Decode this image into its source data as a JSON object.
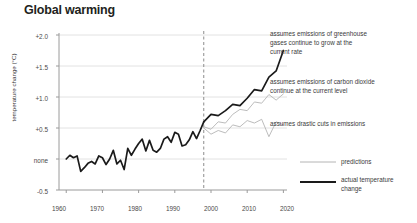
{
  "chart_data": {
    "type": "line",
    "title": "Global warming",
    "xlabel": "",
    "ylabel": "temperature change (°C)",
    "xlim": [
      1958,
      2021
    ],
    "ylim": [
      -0.5,
      2.0
    ],
    "grid": true,
    "legend_position": "bottom-right",
    "x_ticks": [
      "1960",
      "1970",
      "1980",
      "1990",
      "2000",
      "2010",
      "2020"
    ],
    "y_ticks": [
      "+2.0",
      "+1.5",
      "+1.0",
      "+0.5",
      "none",
      "-0.5"
    ],
    "y_tick_values": [
      2.0,
      1.5,
      1.0,
      0.5,
      0.0,
      -0.5
    ],
    "split_year": 1998,
    "series": [
      {
        "name": "actual temperature change",
        "style": "thick-black",
        "x": [
          1960,
          1961,
          1962,
          1963,
          1964,
          1965,
          1966,
          1967,
          1968,
          1969,
          1970,
          1971,
          1972,
          1973,
          1974,
          1975,
          1976,
          1977,
          1978,
          1979,
          1980,
          1981,
          1982,
          1983,
          1984,
          1985,
          1986,
          1987,
          1988,
          1989,
          1990,
          1991,
          1992,
          1993,
          1994,
          1995,
          1996,
          1997,
          1998
        ],
        "values": [
          0.0,
          0.06,
          0.02,
          0.05,
          -0.2,
          -0.14,
          -0.07,
          -0.04,
          -0.08,
          0.05,
          0.02,
          -0.09,
          0.0,
          0.14,
          -0.08,
          -0.02,
          -0.17,
          0.17,
          0.06,
          0.16,
          0.25,
          0.32,
          0.13,
          0.3,
          0.14,
          0.11,
          0.17,
          0.32,
          0.36,
          0.27,
          0.43,
          0.4,
          0.21,
          0.23,
          0.31,
          0.44,
          0.33,
          0.46,
          0.6
        ]
      },
      {
        "name": "assumes emissions of greenhouse gases continue to grow at the current rate",
        "style": "thick-black",
        "x": [
          1998,
          2000,
          2002,
          2004,
          2006,
          2008,
          2010,
          2012,
          2014,
          2016,
          2018,
          2020
        ],
        "values": [
          0.6,
          0.72,
          0.7,
          0.78,
          0.88,
          0.86,
          0.98,
          1.12,
          1.1,
          1.32,
          1.42,
          1.75
        ]
      },
      {
        "name": "assumes emissions of  carbon dioxide continue at the current level",
        "style": "thin-gray",
        "x": [
          1998,
          2000,
          2002,
          2004,
          2006,
          2008,
          2010,
          2012,
          2014,
          2016,
          2018,
          2020
        ],
        "values": [
          0.52,
          0.48,
          0.6,
          0.58,
          0.72,
          0.8,
          0.78,
          0.92,
          0.9,
          1.04,
          0.95,
          1.05
        ]
      },
      {
        "name": "assumes drastic cuts in emissions",
        "style": "thin-gray",
        "x": [
          1998,
          2000,
          2002,
          2004,
          2006,
          2008,
          2010,
          2012,
          2014,
          2016,
          2018,
          2020
        ],
        "values": [
          0.5,
          0.4,
          0.46,
          0.42,
          0.55,
          0.52,
          0.62,
          0.58,
          0.64,
          0.36,
          0.6,
          0.55
        ]
      }
    ],
    "annotations": [
      {
        "text": "assumes emissions of greenhouse\ngases continue to grow at the\ncurrent rate",
        "anchor_x": 270,
        "anchor_y": 30
      },
      {
        "text": "assumes emissions of  carbon dioxide\ncontinue at the current level",
        "anchor_x": 270,
        "anchor_y": 78
      },
      {
        "text": "assumes drastic cuts in emissions",
        "anchor_x": 270,
        "anchor_y": 120
      }
    ],
    "legend": [
      {
        "label": "predictions",
        "style": "thin-gray"
      },
      {
        "label": "actual temperature\nchange",
        "style": "thick-black"
      }
    ],
    "colors": {
      "actual": "#1a1a1a",
      "prediction": "#b4b4b4",
      "grid": "#e2e2e2",
      "axis": "#9a9a9a",
      "text": "#3a3a3a",
      "title": "#231f20"
    }
  }
}
